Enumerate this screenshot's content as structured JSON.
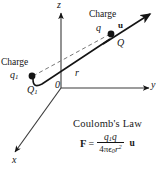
{
  "figure": {
    "background_color": "#ffffff",
    "ink_color": "#141414"
  },
  "axes": {
    "z_label": "z",
    "y_label": "y",
    "x_label": "x",
    "origin_label": "0"
  },
  "charges": {
    "left": {
      "caption": "Charge",
      "charge_symbol": "q",
      "charge_subscript": "1",
      "position_symbol": "Q",
      "position_subscript": "1"
    },
    "right": {
      "caption": "Charge",
      "charge_symbol": "q",
      "position_symbol": "Q",
      "unit_vector_label": "u"
    }
  },
  "distance": {
    "label": "r"
  },
  "formula": {
    "title": "Coulomb's Law",
    "force_symbol": "F",
    "equals": "=",
    "numerator_q1": "q",
    "numerator_q1_sub": "1",
    "numerator_q": "q",
    "denominator_coeff": "4",
    "denominator_pi": "π",
    "denominator_epsilon": "ϵ",
    "denominator_epsilon_sub": "0",
    "denominator_r": "r",
    "denominator_exponent": "2",
    "unit_vector": "u"
  }
}
